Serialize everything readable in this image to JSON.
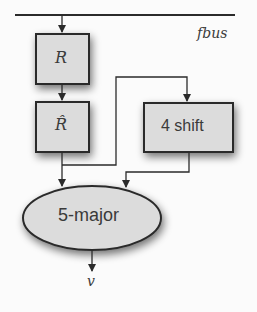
{
  "diagram": {
    "bus": {
      "label": "fbus"
    },
    "nodes": [
      {
        "id": "R",
        "label": "R",
        "shape": "rect",
        "style": "math-italic"
      },
      {
        "id": "R-hat",
        "label": "R̂",
        "shape": "rect",
        "style": "math-italic"
      },
      {
        "id": "4-shift",
        "label": "4 shift",
        "shape": "rect",
        "style": "sans"
      },
      {
        "id": "5-major",
        "label": "5-major",
        "shape": "ellipse",
        "style": "sans"
      }
    ],
    "output": {
      "label": "v"
    },
    "edges": [
      {
        "from": "fbus",
        "to": "R"
      },
      {
        "from": "R",
        "to": "R-hat"
      },
      {
        "from": "R-hat",
        "to": "5-major"
      },
      {
        "from": "R-hat",
        "to": "4-shift"
      },
      {
        "from": "4-shift",
        "to": "5-major"
      },
      {
        "from": "5-major",
        "to": "v"
      }
    ],
    "colors": {
      "node_fill": "#dcdcdc",
      "stroke": "#2b2b2b",
      "background": "#fbfbfb"
    }
  }
}
